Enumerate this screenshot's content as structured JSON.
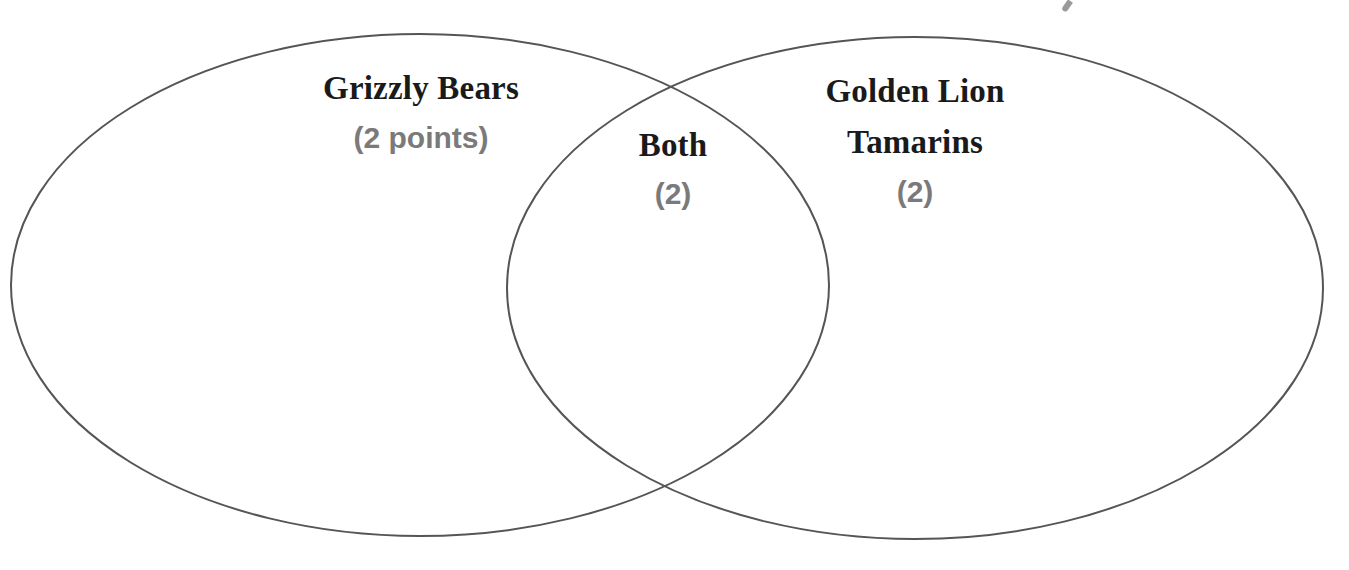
{
  "diagram": {
    "type": "venn",
    "stroke_color": "#555555",
    "sets": [
      {
        "id": "left",
        "title": "Grizzly Bears",
        "points": "(2 points)",
        "ellipse": {
          "cx": 420,
          "cy": 285,
          "rx": 409,
          "ry": 251
        }
      },
      {
        "id": "right",
        "title_line1": "Golden Lion",
        "title_line2": "Tamarins",
        "points": "(2)",
        "ellipse": {
          "cx": 915,
          "cy": 288,
          "rx": 408,
          "ry": 251
        }
      }
    ],
    "intersection": {
      "title": "Both",
      "points": "(2)"
    }
  }
}
